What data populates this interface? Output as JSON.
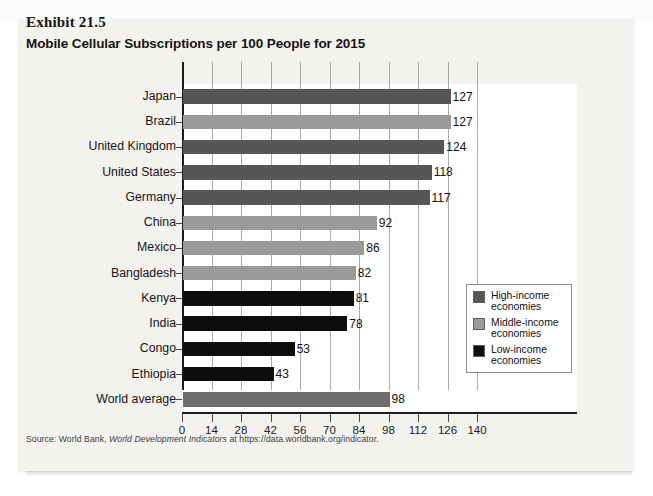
{
  "exhibit": {
    "label": "Exhibit 21.5",
    "title": "Mobile Cellular Subscriptions per 100 People for 2015"
  },
  "source": {
    "prefix": "Source: World Bank,",
    "italic": "World Development Indicators",
    "suffix": "at https://data.worldbank.org/indicator."
  },
  "legend": {
    "items": [
      {
        "key": "high",
        "label": "High-income economies",
        "color": "#565656"
      },
      {
        "key": "middle",
        "label": "Middle-income economies",
        "color": "#9a9a9a"
      },
      {
        "key": "low",
        "label": "Low-income economies",
        "color": "#0d0d0d"
      }
    ]
  },
  "chart_data": {
    "type": "bar",
    "orientation": "horizontal",
    "title": "Mobile Cellular Subscriptions per 100 People for 2015",
    "xlabel": "",
    "ylabel": "",
    "xlim": [
      0,
      140
    ],
    "xticks": [
      0,
      14,
      28,
      42,
      56,
      70,
      84,
      98,
      112,
      126,
      140
    ],
    "grid": true,
    "legend_position": "inside-right",
    "categories": [
      "Japan",
      "Brazil",
      "United Kingdom",
      "United States",
      "Germany",
      "China",
      "Mexico",
      "Bangladesh",
      "Kenya",
      "India",
      "Congo",
      "Ethiopia",
      "World average"
    ],
    "values": [
      127,
      127,
      124,
      118,
      117,
      92,
      86,
      82,
      81,
      78,
      53,
      43,
      98
    ],
    "groups": [
      "high",
      "middle",
      "high",
      "high",
      "high",
      "middle",
      "middle",
      "middle",
      "low",
      "low",
      "low",
      "low",
      "world"
    ],
    "group_colors": {
      "high": "#565656",
      "middle": "#9a9a9a",
      "low": "#0d0d0d",
      "world": "#6e6e6e"
    }
  }
}
